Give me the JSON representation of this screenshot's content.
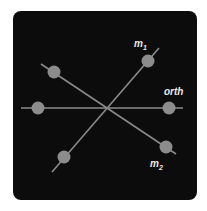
{
  "diagram": {
    "background": "#0c0c0c",
    "line_color": "#8a8a8a",
    "node_color": "#8c8c8c",
    "center": [
      107,
      108
    ],
    "lines": [
      {
        "name": "m1",
        "label": "m",
        "subscript": "1",
        "from": [
          52,
          172
        ],
        "to": [
          159,
          48
        ],
        "label_pos": [
          135,
          44
        ]
      },
      {
        "name": "m2",
        "label": "m",
        "subscript": "2",
        "from": [
          41,
          64
        ],
        "to": [
          176,
          154
        ],
        "label_pos": [
          150,
          170
        ]
      },
      {
        "name": "orth",
        "label": "orth",
        "subscript": "",
        "from": [
          21,
          108
        ],
        "to": [
          183,
          108
        ],
        "label_pos": [
          163,
          94
        ]
      }
    ],
    "nodes": [
      {
        "line": "m1",
        "x": 148,
        "y": 61
      },
      {
        "line": "m1",
        "x": 64,
        "y": 157
      },
      {
        "line": "m2",
        "x": 54,
        "y": 72
      },
      {
        "line": "m2",
        "x": 166,
        "y": 147
      },
      {
        "line": "orth",
        "x": 38,
        "y": 108
      },
      {
        "line": "orth",
        "x": 169,
        "y": 108
      }
    ],
    "labels": {
      "m1_base": "m",
      "m1_sub": "1",
      "m2_base": "m",
      "m2_sub": "2",
      "orth": "orth"
    }
  }
}
